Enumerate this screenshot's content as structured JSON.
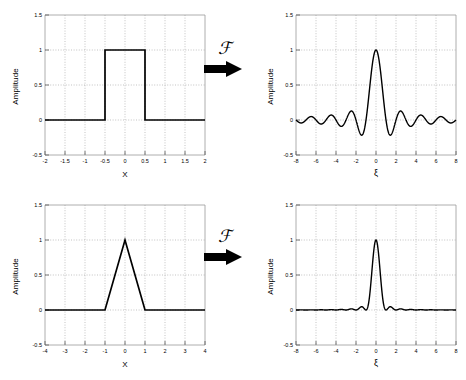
{
  "figure": {
    "operator_symbol": "ℱ",
    "arrow_icon": "right-arrow-icon",
    "background": "#ffffff",
    "curve_color": "#000000",
    "grid_color": "#b0b0b0",
    "axis_color": "#808080"
  },
  "panels": [
    {
      "id": "rect-function",
      "position": "top-left",
      "chart_data": {
        "type": "line",
        "title": "",
        "xlabel": "X",
        "ylabel": "Amplitude",
        "xlim": [
          -2,
          2
        ],
        "ylim": [
          -0.5,
          1.5
        ],
        "xticks": [
          "-2",
          "-1.5",
          "-1",
          "-0.5",
          "0",
          "0.5",
          "1",
          "1.5",
          "2"
        ],
        "xtick_values": [
          -2,
          -1.5,
          -1,
          -0.5,
          0,
          0.5,
          1,
          1.5,
          2
        ],
        "yticks": [
          "-0.5",
          "0",
          "0.5",
          "1",
          "1.5"
        ],
        "ytick_values": [
          -0.5,
          0,
          0.5,
          1,
          1.5
        ],
        "grid": true,
        "legend": false,
        "series": [
          {
            "name": "rect(x)",
            "description": "Rectangle function: 1 for |x| < 0.5, else 0",
            "x": [
              -2,
              -0.5,
              -0.5,
              0.5,
              0.5,
              2
            ],
            "values": [
              0,
              0,
              1,
              1,
              0,
              0
            ]
          }
        ]
      }
    },
    {
      "id": "sinc-function",
      "position": "top-right",
      "chart_data": {
        "type": "line",
        "title": "",
        "xlabel": "ξ",
        "ylabel": "Amplitude",
        "xlim": [
          -8,
          8
        ],
        "ylim": [
          -0.5,
          1.5
        ],
        "xticks": [
          "-8",
          "-6",
          "-4",
          "-2",
          "0",
          "2",
          "4",
          "6",
          "8"
        ],
        "xtick_values": [
          -8,
          -6,
          -4,
          -2,
          0,
          2,
          4,
          6,
          8
        ],
        "yticks": [
          "-0.5",
          "0",
          "0.5",
          "1",
          "1.5"
        ],
        "ytick_values": [
          -0.5,
          0,
          0.5,
          1,
          1.5
        ],
        "grid": true,
        "legend": false,
        "series": [
          {
            "name": "sinc(ξ)",
            "description": "sin(pi*xi)/(pi*xi), peak 1 at xi=0, zeros at every integer",
            "formula": "sinc",
            "peak": 1.0,
            "first_side_lobe": -0.217,
            "second_side_lobe": 0.128
          }
        ]
      }
    },
    {
      "id": "triangle-function",
      "position": "bottom-left",
      "chart_data": {
        "type": "line",
        "title": "",
        "xlabel": "X",
        "ylabel": "Amplitude",
        "xlim": [
          -4,
          4
        ],
        "ylim": [
          -0.5,
          1.5
        ],
        "xticks": [
          "-4",
          "-3",
          "-2",
          "-1",
          "0",
          "1",
          "2",
          "3",
          "4"
        ],
        "xtick_values": [
          -4,
          -3,
          -2,
          -1,
          0,
          1,
          2,
          3,
          4
        ],
        "yticks": [
          "-0.5",
          "0",
          "0.5",
          "1",
          "1.5"
        ],
        "ytick_values": [
          -0.5,
          0,
          0.5,
          1,
          1.5
        ],
        "grid": true,
        "legend": false,
        "series": [
          {
            "name": "tri(x)",
            "description": "Triangle function: 1-|x| for |x| < 1, else 0",
            "x": [
              -4,
              -1,
              0,
              1,
              4
            ],
            "values": [
              0,
              0,
              1,
              0,
              0
            ]
          }
        ]
      }
    },
    {
      "id": "sinc-squared-function",
      "position": "bottom-right",
      "chart_data": {
        "type": "line",
        "title": "",
        "xlabel": "ξ",
        "ylabel": "Amplitude",
        "xlim": [
          -8,
          8
        ],
        "ylim": [
          -0.5,
          1.5
        ],
        "xticks": [
          "-8",
          "-6",
          "-4",
          "-2",
          "0",
          "2",
          "4",
          "6",
          "8"
        ],
        "xtick_values": [
          -8,
          -6,
          -4,
          -2,
          0,
          2,
          4,
          6,
          8
        ],
        "yticks": [
          "-0.5",
          "0",
          "0.5",
          "1",
          "1.5"
        ],
        "ytick_values": [
          -0.5,
          0,
          0.5,
          1,
          1.5
        ],
        "grid": true,
        "legend": false,
        "series": [
          {
            "name": "sinc²(ξ)",
            "description": "[sin(pi*xi)/(pi*xi)]^2, peak 1 at xi=0, zeros at every nonzero integer",
            "formula": "sinc2",
            "peak": 1.0,
            "first_side_lobe": 0.047,
            "second_side_lobe": 0.017
          }
        ]
      }
    }
  ],
  "operators": [
    {
      "id": "operator-top",
      "symbol": "ℱ",
      "label": "Fourier transform"
    },
    {
      "id": "operator-bottom",
      "symbol": "ℱ",
      "label": "Fourier transform"
    }
  ]
}
